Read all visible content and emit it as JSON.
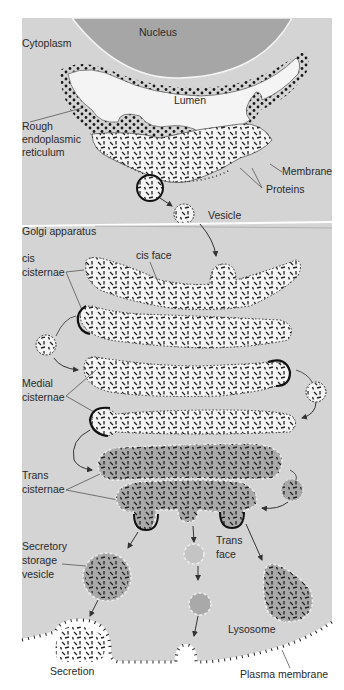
{
  "diagram": {
    "colors": {
      "background": "#ffffff",
      "cytoplasm": "#d4d4d4",
      "nucleus": "#a6a6a6",
      "lumen": "#f4f4f4",
      "trans_lumen": "#a9a9a9",
      "ribosome": "#1a1a1a",
      "protein": "#222222",
      "membrane_outline": "#333333"
    },
    "labels": {
      "nucleus": "Nucleus",
      "cytoplasm": "Cytoplasm",
      "lumen": "Lumen",
      "rough_er_1": "Rough",
      "rough_er_2": "endoplasmic",
      "rough_er_3": "reticulum",
      "membrane": "Membrane",
      "proteins": "Proteins",
      "vesicle": "Vesicle",
      "golgi": "Golgi apparatus",
      "cis_face": "cis face",
      "cis_cisternae_1": "cis",
      "cis_cisternae_2": "cisternae",
      "medial_cisternae_1": "Medial",
      "medial_cisternae_2": "cisternae",
      "trans_cisternae_1": "Trans",
      "trans_cisternae_2": "cisternae",
      "secretory_1": "Secretory",
      "secretory_2": "storage",
      "secretory_3": "vesicle",
      "trans_face_1": "Trans",
      "trans_face_2": "face",
      "lysosome": "Lysosome",
      "secretion": "Secretion",
      "plasma_membrane": "Plasma  membrane"
    }
  }
}
